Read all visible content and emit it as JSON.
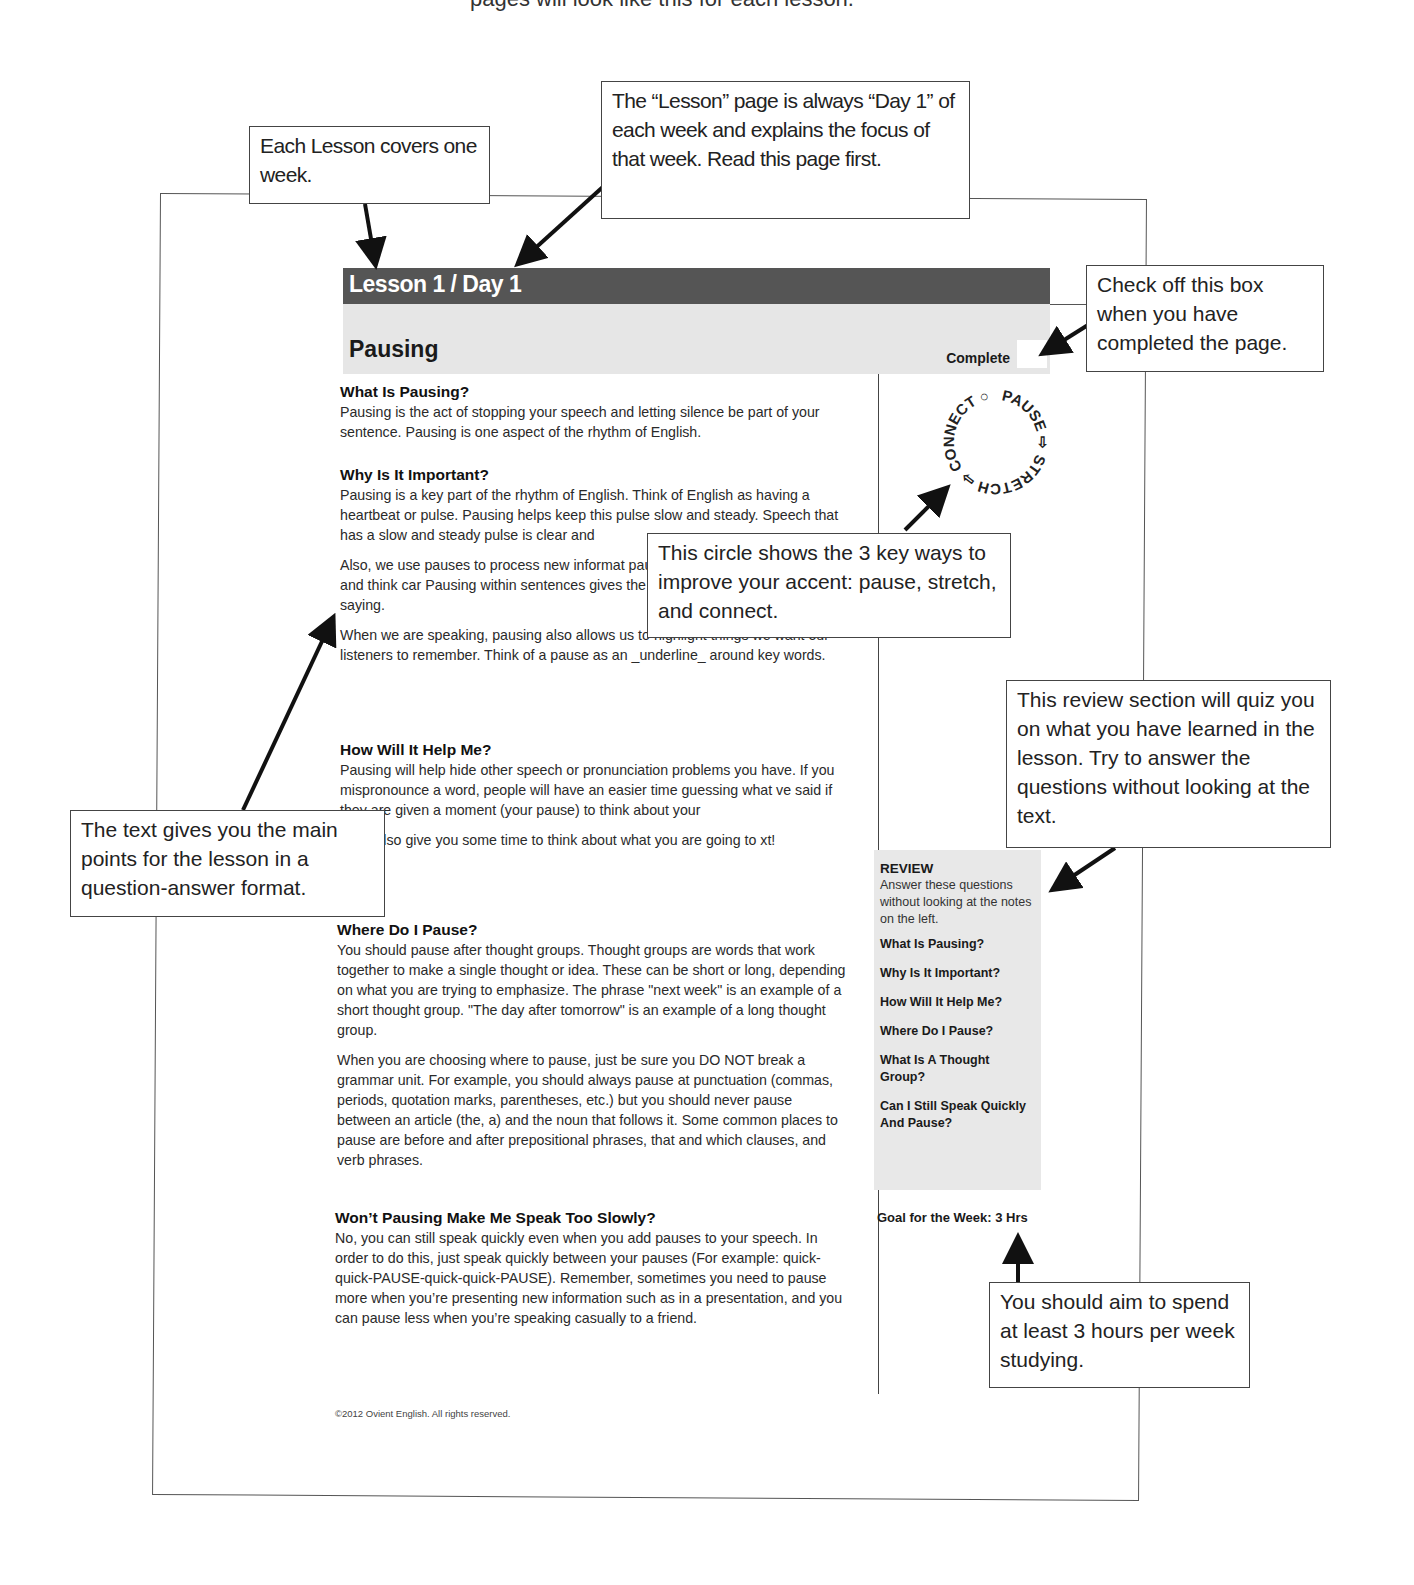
{
  "top_caption": "pages will look like this for each lesson.",
  "lesson_page": {
    "header": "Lesson 1 / Day 1",
    "title": "Pausing",
    "complete_label": "Complete",
    "sections": [
      {
        "heading": "What Is Pausing?",
        "paragraphs": [
          "Pausing is the act of stopping your speech and letting silence be part of your sentence. Pausing is one aspect of the rhythm of English."
        ]
      },
      {
        "heading": "Why Is It Important?",
        "paragraphs": [
          "Pausing is a key part of the rhythm of English. Think of English as having a heartbeat or pulse. Pausing helps keep this pulse slow and steady. Speech that has a slow and steady pulse is clear and",
          "Also, we use pauses to process new informat pausing, it is difficult to listen to and think car Pausing within sentences gives the listener a what the speaker is saying.",
          "When we are speaking, pausing also allows us to highlight things we want our listeners to remember. Think of a pause as an _underline_ around key words."
        ]
      },
      {
        "heading": "How Will It Help Me?",
        "paragraphs": [
          "Pausing will help hide other speech or pronunciation problems you have. If you mispronounce a word, people will have an easier time guessing what ve said if they are given a moment (your pause) to think about your",
          "g will also give you some time to think about what you are going to xt!"
        ]
      },
      {
        "heading": "Where Do I Pause?",
        "paragraphs": [
          "You should pause after thought groups. Thought groups are words that work together to make a single thought or idea. These can be short or long, depending on what you are trying to emphasize. The phrase \"next week\" is an example of a short thought group. \"The day after tomorrow\" is an example of a long thought group.",
          "When you are choosing where to pause, just be sure you DO NOT break a grammar unit. For example, you should always pause at punctuation (commas, periods, quotation marks, parentheses, etc.) but you should never pause between an article (the, a) and the noun that follows it. Some common places to pause are before and after prepositional phrases, that and which clauses, and verb phrases."
        ]
      },
      {
        "heading": "Won’t Pausing Make Me Speak Too Slowly?",
        "paragraphs": [
          "No, you can still speak quickly even when you add pauses to your speech. In order to do this, just speak quickly between your pauses (For example: quick-quick-PAUSE-quick-quick-PAUSE). Remember, sometimes you need to pause more when you’re presenting new information such as in a presentation, and you can pause less when you’re speaking casually to a friend."
        ]
      }
    ],
    "circle_words": [
      "PAUSE",
      "STRETCH",
      "CONNECT"
    ],
    "review": {
      "heading": "REVIEW",
      "instructions": "Answer these questions without looking at the notes on the left.",
      "questions": [
        "What Is Pausing?",
        "Why Is It Important?",
        "How Will It Help Me?",
        "Where Do I Pause?",
        "What Is A Thought Group?",
        "Can I Still Speak Quickly And Pause?"
      ]
    },
    "goal": "Goal for the Week: 3 Hrs",
    "footer": "©2012 Ovient English. All rights reserved."
  },
  "callouts": {
    "lesson_week": "Each Lesson covers one week.",
    "day_one": "The “Lesson” page is always “Day 1” of each week and explains the focus of that week. Read this page first.",
    "checkbox": "Check off this box when you have completed the page.",
    "circle": "This circle shows the 3 key ways to improve your accent: pause, stretch, and connect.",
    "review": "This review section will quiz you on what you have learned in the lesson. Try to answer the questions without looking at the text.",
    "text": "The text gives you the main points for the lesson in a question-answer format.",
    "goal": "You should aim to spend at least 3 hours per week studying."
  }
}
